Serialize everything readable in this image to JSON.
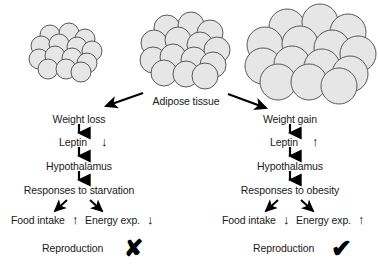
{
  "figure": {
    "center_label": "Adipose tissue",
    "clusters": [
      {
        "name": "small-adipocyte-cluster",
        "semantic": "lean-adipose-tissue"
      },
      {
        "name": "medium-adipocyte-cluster",
        "semantic": "normal-adipose-tissue"
      },
      {
        "name": "large-adipocyte-cluster",
        "semantic": "obese-adipose-tissue"
      }
    ],
    "colors": {
      "cell_fill": "#e6e6e6",
      "cell_stroke": "#595959",
      "text": "#1a1a1a",
      "arrow": "#000000"
    }
  },
  "left_branch": {
    "name": "weight-loss-pathway",
    "steps": [
      {
        "label": "Weight loss",
        "trend": ""
      },
      {
        "label": "Leptin",
        "trend": "↓"
      },
      {
        "label": "Hypothalamus",
        "trend": ""
      },
      {
        "label": "Responses to starvation",
        "trend": ""
      }
    ],
    "outcomes": [
      {
        "label": "Food intake",
        "trend": "↑"
      },
      {
        "label": "Energy exp.",
        "trend": "↓"
      }
    ],
    "reproduction": {
      "label": "Reproduction",
      "verdict": "✘",
      "verdict_name": "cross-mark"
    }
  },
  "right_branch": {
    "name": "weight-gain-pathway",
    "steps": [
      {
        "label": "Weight gain",
        "trend": ""
      },
      {
        "label": "Leptin",
        "trend": "↑"
      },
      {
        "label": "Hypothalamus",
        "trend": ""
      },
      {
        "label": "Responses to obesity",
        "trend": ""
      }
    ],
    "outcomes": [
      {
        "label": "Food intake",
        "trend": "↓"
      },
      {
        "label": "Energy exp.",
        "trend": "↑"
      }
    ],
    "reproduction": {
      "label": "Reproduction",
      "verdict": "✔",
      "verdict_name": "check-mark"
    }
  }
}
